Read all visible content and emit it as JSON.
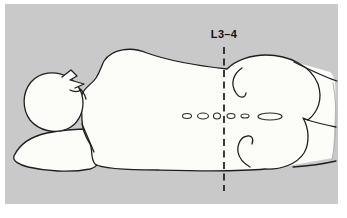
{
  "illustration": {
    "label": "L3–4",
    "colors": {
      "page_background": "#ffffff",
      "panel_background": "#c9c9c9",
      "body_fill": "#fcfcf9",
      "outline": "#1f1f1f",
      "marker_line": "#1a1a1a",
      "label_text": "#111111"
    }
  }
}
